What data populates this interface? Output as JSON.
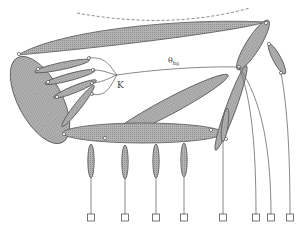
{
  "diagram": {
    "labels": {
      "k": "K",
      "theta": "θ",
      "theta_sub": "hg"
    },
    "colors": {
      "segment_fill": "#a9a9a9",
      "segment_stroke": "#555555",
      "wire": "#6a6a6a",
      "background": "#ffffff"
    },
    "anchors_count": 8
  }
}
